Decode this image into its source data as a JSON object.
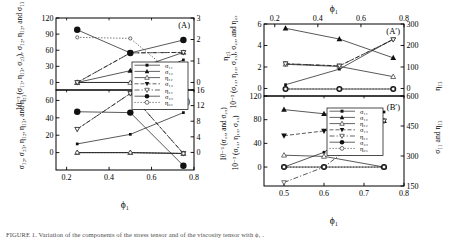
{
  "figure": {
    "caption": "FIGURE 1. Variation of the components of the stress tensor and of the viscosity tensor with ϕ₁ .",
    "panels": [
      "A",
      "B",
      "A'",
      "B'"
    ]
  },
  "left_group": {
    "xlabel": "ϕ₁",
    "xticks": [
      "0.2",
      "0.4",
      "0.6",
      "0.8"
    ],
    "xlim": [
      0.15,
      0.8
    ],
    "panelA": {
      "tag": "(A)",
      "ylabel_left": "10⁻³ (σ₁₁, η₁₃, σ₂₃), σ₁₂, η₁₂, and σ₁₃",
      "ylabel_right": "η₂₃",
      "yticks_left": [
        "0",
        "30",
        "60",
        "90",
        "120"
      ],
      "ylim_left": [
        -14,
        120
      ],
      "yticks_right": [
        "0",
        "1",
        "2",
        "3"
      ],
      "ylim_right": [
        -0.35,
        3
      ]
    },
    "panelB": {
      "tag": "(B)",
      "ylabel_left": "σ₁₂, σ₂₃, η₁₂, η₁₃, and η₂₃",
      "ylabel_right": "10⁻³ (σ₁₃, and σ₂₃)",
      "yticks_left": [
        "0",
        "20",
        "40",
        "60"
      ],
      "ylim_left": [
        -20,
        72
      ],
      "yticks_right": [
        "0",
        "4",
        "8",
        "12",
        "16"
      ],
      "ylim_right": [
        -4.5,
        16
      ]
    },
    "legend": {
      "entries": [
        {
          "label": "σ₁₁",
          "marker": "square-filled",
          "line": "solid"
        },
        {
          "label": "σ₁₂",
          "marker": "triangle-up-filled",
          "line": "solid"
        },
        {
          "label": "η₁₂",
          "marker": "triangle-up-open",
          "line": "solid"
        },
        {
          "label": "σ₁₃",
          "marker": "triangle-down-filled",
          "line": "dashed"
        },
        {
          "label": "η₁₃",
          "marker": "triangle-down-open",
          "line": "dash-dot"
        },
        {
          "label": "σ₂₃",
          "marker": "circle-filled",
          "line": "solid"
        },
        {
          "label": "η₂₃",
          "marker": "circle-open",
          "line": "dotted"
        }
      ]
    }
  },
  "right_group": {
    "xlabel_top": "ϕ₁",
    "xlabel_bottom": "ϕ₁",
    "xticks_top": [
      "0.2",
      "0.4",
      "0.6",
      "0.8"
    ],
    "xlim_top": [
      0.15,
      0.8
    ],
    "xticks_bottom": [
      "0.5",
      "0.6",
      "0.7",
      "0.8"
    ],
    "xlim_bottom": [
      0.45,
      0.8
    ],
    "panelAp": {
      "tag": "(A′)",
      "ylabel_left": "10⁻³ (σ₁₂, η₁₂, σ₁₃), σ₂₃, and η₂₃",
      "ylabel_right": "η₁₃",
      "yticks_left": [
        "0",
        "2",
        "4",
        "6"
      ],
      "ylim_left": [
        -0.7,
        6
      ],
      "yticks_right": [
        "0",
        "100",
        "200",
        "300"
      ],
      "ylim_right": [
        -35,
        300
      ]
    },
    "panelBp": {
      "tag": "(B′)",
      "ylabel_left": "10⁻³ (σ₁₂, η₁₂, σ₁₃)",
      "ylabel_right": "σ₁₁ and η₁₃",
      "yticks_left": [
        "0",
        "40",
        "80",
        "120"
      ],
      "ylim_left": [
        -32,
        120
      ],
      "yticks_right": [
        "150",
        "300",
        "450",
        "600"
      ],
      "ylim_right": [
        150,
        600
      ]
    },
    "legend": {
      "entries": [
        {
          "label": "σ₁₁",
          "marker": "square-filled",
          "line": "solid"
        },
        {
          "label": "σ₁₂",
          "marker": "triangle-up-filled",
          "line": "solid"
        },
        {
          "label": "η₁₂",
          "marker": "triangle-up-open",
          "line": "solid"
        },
        {
          "label": "σ₁₃",
          "marker": "triangle-down-filled",
          "line": "dashed"
        },
        {
          "label": "η₁₃",
          "marker": "triangle-down-open",
          "line": "dash-dot"
        },
        {
          "label": "σ₂₃",
          "marker": "circle-filled",
          "line": "solid"
        },
        {
          "label": "η₂₃",
          "marker": "circle-open",
          "line": "dotted"
        }
      ]
    }
  },
  "chart_data": [
    {
      "type": "scatter",
      "id": "panel-A",
      "title": "(A)",
      "xlabel": "ϕ₁",
      "ylabel": "10⁻³ (σ₁₁, η₁₃, σ₂₃), σ₁₂, η₁₂, and σ₁₃",
      "ylabel_right": "η₂₃",
      "x": [
        0.25,
        0.5,
        0.75
      ],
      "xlim": [
        0.15,
        0.8
      ],
      "ylim": [
        -14,
        120
      ],
      "ylim_right": [
        -0.35,
        3
      ],
      "grid": false,
      "legend_position": "center-right",
      "series": [
        {
          "name": "σ₁₁",
          "axis": "left",
          "marker": "square-filled",
          "line": "solid",
          "values": [
            0,
            0,
            42
          ]
        },
        {
          "name": "σ₁₂",
          "axis": "left",
          "marker": "triangle-up-filled",
          "line": "solid",
          "values": [
            0,
            22,
            56
          ]
        },
        {
          "name": "η₁₂",
          "axis": "left",
          "marker": "triangle-up-open",
          "line": "solid",
          "values": [
            0,
            0,
            0
          ]
        },
        {
          "name": "σ₁₃",
          "axis": "left",
          "marker": "triangle-down-filled",
          "line": "dashed",
          "values": [
            0,
            55,
            56
          ]
        },
        {
          "name": "η₁₃",
          "axis": "left",
          "marker": "triangle-down-open",
          "line": "dash-dot",
          "values": [
            0,
            55,
            56
          ]
        },
        {
          "name": "σ₂₃",
          "axis": "left",
          "marker": "circle-filled",
          "line": "solid",
          "values": [
            98,
            55,
            79
          ]
        },
        {
          "name": "η₂₃",
          "axis": "right",
          "marker": "circle-open",
          "line": "dotted",
          "values": [
            2.1,
            2.05,
            0.0
          ]
        }
      ]
    },
    {
      "type": "scatter",
      "id": "panel-B",
      "title": "(B)",
      "xlabel": "ϕ₁",
      "ylabel": "σ₁₂, σ₂₃, η₁₂, η₁₃, and η₂₃",
      "ylabel_right": "10⁻³ (σ₁₃, and σ₂₃)",
      "x": [
        0.25,
        0.5,
        0.75
      ],
      "xlim": [
        0.15,
        0.8
      ],
      "ylim": [
        -20,
        72
      ],
      "ylim_right": [
        -4.5,
        16
      ],
      "grid": false,
      "legend_position": "center-right",
      "series": [
        {
          "name": "σ₁₁",
          "axis": "left",
          "marker": "square-filled",
          "line": "solid",
          "values": [
            10,
            21,
            46
          ]
        },
        {
          "name": "σ₁₂",
          "axis": "left",
          "marker": "triangle-up-filled",
          "line": "solid",
          "values": [
            0,
            0,
            -1
          ]
        },
        {
          "name": "η₁₂",
          "axis": "left",
          "marker": "triangle-up-open",
          "line": "solid",
          "values": [
            0,
            0,
            -1
          ]
        },
        {
          "name": "σ₁₃",
          "axis": "left",
          "marker": "triangle-down-filled",
          "line": "dashed",
          "values": [
            27,
            68,
            -1
          ]
        },
        {
          "name": "η₁₃",
          "axis": "left",
          "marker": "triangle-down-open",
          "line": "dash-dot",
          "values": [
            27,
            68,
            -1
          ]
        },
        {
          "name": "σ₂₃",
          "axis": "left",
          "marker": "circle-filled",
          "line": "solid",
          "values": [
            47,
            46,
            -15
          ]
        },
        {
          "name": "η₂₃",
          "axis": "left",
          "marker": "circle-open",
          "line": "dotted",
          "values": [
            0,
            0,
            -1
          ]
        }
      ]
    },
    {
      "type": "scatter",
      "id": "panel-Aprime",
      "title": "(A′)",
      "xlabel": "ϕ₁",
      "ylabel": "10⁻³ (σ₁₂, η₁₂, σ₁₃), σ₂₃, and η₂₃",
      "ylabel_right": "η₁₃",
      "x": [
        0.25,
        0.5,
        0.75
      ],
      "xlim": [
        0.15,
        0.8
      ],
      "ylim": [
        -0.7,
        6
      ],
      "ylim_right": [
        -35,
        300
      ],
      "grid": false,
      "legend_position": "bottom-center",
      "series": [
        {
          "name": "σ₁₁",
          "axis": "left",
          "marker": "square-filled",
          "line": "solid",
          "values": [
            0.35,
            1.8,
            4.6
          ]
        },
        {
          "name": "σ₁₂",
          "axis": "left",
          "marker": "triangle-up-filled",
          "line": "solid",
          "values": [
            5.6,
            4.6,
            2.85
          ]
        },
        {
          "name": "η₁₂",
          "axis": "left",
          "marker": "triangle-up-open",
          "line": "solid",
          "values": [
            2.25,
            2.05,
            1.1
          ]
        },
        {
          "name": "σ₁₃",
          "axis": "left",
          "marker": "triangle-down-filled",
          "line": "dashed",
          "values": [
            2.3,
            2.1,
            4.55
          ]
        },
        {
          "name": "η₁₃",
          "axis": "left",
          "marker": "triangle-down-open",
          "line": "dash-dot",
          "values": [
            2.3,
            2.1,
            4.55
          ]
        },
        {
          "name": "σ₂₃",
          "axis": "left",
          "marker": "circle-filled",
          "line": "solid",
          "values": [
            -0.05,
            -0.05,
            -0.05
          ]
        },
        {
          "name": "η₂₃",
          "axis": "left",
          "marker": "circle-open",
          "line": "dotted",
          "values": [
            -0.05,
            -0.05,
            -0.05
          ]
        }
      ]
    },
    {
      "type": "scatter",
      "id": "panel-Bprime",
      "title": "(B′)",
      "xlabel": "ϕ₁",
      "ylabel": "10⁻³ (σ₁₂, η₁₂, σ₁₃)",
      "ylabel_right": "σ₁₁ and η₁₃",
      "x": [
        0.5,
        0.6,
        0.75
      ],
      "xlim": [
        0.45,
        0.8
      ],
      "ylim": [
        -32,
        120
      ],
      "ylim_right": [
        150,
        600
      ],
      "grid": false,
      "legend_position": "center",
      "series": [
        {
          "name": "σ₁₁",
          "axis": "left",
          "marker": "square-filled",
          "line": "solid",
          "values": [
            0,
            25,
            93
          ]
        },
        {
          "name": "σ₁₂",
          "axis": "left",
          "marker": "triangle-up-filled",
          "line": "solid",
          "values": [
            97,
            90,
            78
          ]
        },
        {
          "name": "η₁₂",
          "axis": "left",
          "marker": "triangle-up-open",
          "line": "solid",
          "values": [
            20,
            18,
            0
          ]
        },
        {
          "name": "σ₁₃",
          "axis": "left",
          "marker": "triangle-down-filled",
          "line": "dashed",
          "values": [
            53,
            61,
            78
          ]
        },
        {
          "name": "η₁₃",
          "axis": "left",
          "marker": "triangle-down-open",
          "line": "dash-dot",
          "values": [
            -26,
            0,
            78
          ]
        },
        {
          "name": "σ₂₃",
          "axis": "left",
          "marker": "circle-filled",
          "line": "solid",
          "values": [
            0,
            0,
            0
          ]
        },
        {
          "name": "η₂₃",
          "axis": "left",
          "marker": "circle-open",
          "line": "dotted",
          "values": [
            0,
            0,
            0
          ]
        }
      ]
    }
  ]
}
